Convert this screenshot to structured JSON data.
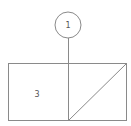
{
  "diagram": {
    "node_top": {
      "label": "1",
      "shape": "circle"
    },
    "box_left": {
      "label": "3",
      "shape": "rectangle"
    },
    "box_right": {
      "shape": "rectangle-with-diagonal"
    },
    "colors": {
      "line": "#8a8a8a",
      "text": "#555555",
      "background": "#ffffff"
    }
  }
}
